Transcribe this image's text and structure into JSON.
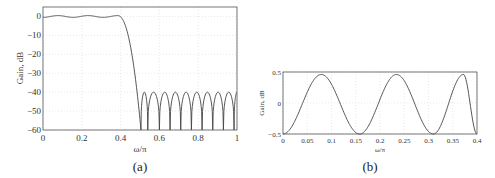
{
  "chart_data": [
    {
      "type": "line",
      "panel": "(a)",
      "title": "",
      "xlabel": "ω/π",
      "ylabel": "Gain, dB",
      "xlim": [
        0,
        1
      ],
      "ylim": [
        -60,
        5
      ],
      "xticks": [
        0,
        0.2,
        0.4,
        0.6,
        0.8,
        1
      ],
      "xtick_labels": [
        "0",
        "0.2",
        "0.4",
        "0.6",
        "0.8",
        "1"
      ],
      "yticks": [
        0,
        -10,
        -20,
        -30,
        -40,
        -50,
        -60
      ],
      "ytick_labels": [
        "0",
        "−10",
        "−20",
        "−30",
        "−40",
        "−50",
        "−60"
      ],
      "grid": true,
      "description": "Lowpass equiripple filter magnitude response: passband ripple ±0.5 dB up to 0.4, transition to ~0.5, stopband ripple peaks at -40 dB with nulls",
      "series": [
        {
          "name": "gain",
          "x": [
            0,
            0.04,
            0.08,
            0.12,
            0.16,
            0.2,
            0.24,
            0.28,
            0.32,
            0.36,
            0.38,
            0.4,
            0.42,
            0.44,
            0.46,
            0.48,
            0.5,
            0.505
          ],
          "y": [
            -0.5,
            0.3,
            0.45,
            0.1,
            -0.5,
            0.1,
            0.45,
            0.0,
            -0.5,
            0.4,
            0.45,
            -1.5,
            -6,
            -14,
            -25,
            -40,
            -55,
            -60
          ]
        }
      ],
      "stopband": {
        "start": 0.505,
        "end": 1.0,
        "peak_db": -40,
        "null_db": -60,
        "nulls": [
          0.505,
          0.54,
          0.6,
          0.655,
          0.71,
          0.765,
          0.82,
          0.875,
          0.93,
          0.985
        ]
      }
    },
    {
      "type": "line",
      "panel": "(b)",
      "title": "",
      "xlabel": "ω/π",
      "ylabel": "Gain, dB",
      "xlim": [
        0,
        0.4
      ],
      "ylim": [
        -0.5,
        0.5
      ],
      "xticks": [
        0,
        0.05,
        0.1,
        0.15,
        0.2,
        0.25,
        0.3,
        0.35,
        0.4
      ],
      "xtick_labels": [
        "0",
        "0.05",
        "0.1",
        "0.15",
        "0.2",
        "0.25",
        "0.3",
        "0.35",
        "0.4"
      ],
      "yticks": [
        0.5,
        0,
        -0.5
      ],
      "ytick_labels": [
        "0.5",
        "0",
        "−0.5"
      ],
      "grid": true,
      "description": "Passband detail: equiripple oscillation between -0.5 and +0.46 dB",
      "series": [
        {
          "name": "gain",
          "x": [
            0,
            0.04,
            0.083,
            0.12,
            0.158,
            0.2,
            0.238,
            0.27,
            0.31,
            0.34,
            0.372,
            0.39,
            0.4
          ],
          "y": [
            -0.5,
            0.0,
            0.46,
            0.0,
            -0.5,
            0.0,
            0.46,
            0.0,
            -0.5,
            0.0,
            0.46,
            0.0,
            -0.5
          ]
        }
      ]
    }
  ],
  "captions": {
    "a": "(a)",
    "b": "(b)"
  },
  "axes_a": {
    "xlabel": "ω/π",
    "ylabel": "Gain, dB"
  },
  "axes_b": {
    "xlabel": "ω/π",
    "ylabel": "Gain, dB"
  }
}
